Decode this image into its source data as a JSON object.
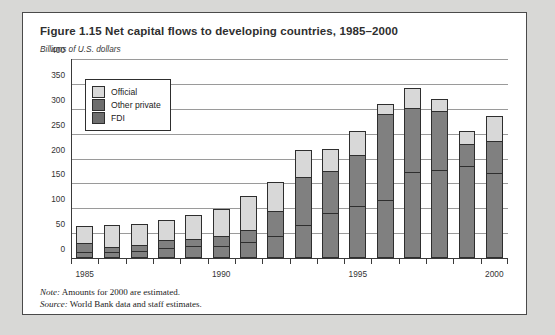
{
  "figure": {
    "title": "Figure 1.15  Net capital flows to developing countries, 1985–2000",
    "unit_label": "Billions of U.S. dollars",
    "note_key": "Note:",
    "note_text": " Amounts for 2000 are estimated.",
    "source_key": "Source:",
    "source_text": " World Bank data and staff estimates."
  },
  "legend": {
    "items": [
      {
        "label": "Official",
        "color": "#d8d8d8"
      },
      {
        "label": "Other private",
        "color": "#6e6e6e"
      },
      {
        "label": "FDI",
        "color": "#6e6e6e"
      }
    ]
  },
  "chart_data": {
    "type": "bar",
    "stacked": true,
    "title": "Figure 1.15  Net capital flows to developing countries, 1985–2000",
    "xlabel": "",
    "ylabel": "Billions of U.S. dollars",
    "ylim": [
      0,
      400
    ],
    "yticks": [
      0,
      50,
      100,
      150,
      200,
      250,
      300,
      350,
      400
    ],
    "grid": true,
    "legend_position": "top-left",
    "categories": [
      1985,
      1986,
      1987,
      1988,
      1989,
      1990,
      1991,
      1992,
      1993,
      1994,
      1995,
      1996,
      1997,
      1998,
      1999,
      2000
    ],
    "xtick_labels": [
      "1985",
      "1990",
      "1995",
      "2000"
    ],
    "xtick_label_years": [
      1985,
      1990,
      1995,
      2000
    ],
    "series": [
      {
        "name": "FDI",
        "color": "#808080",
        "values": [
          12,
          12,
          14,
          20,
          24,
          24,
          33,
          45,
          66,
          90,
          104,
          117,
          172,
          176,
          185,
          170
        ]
      },
      {
        "name": "Other private",
        "color": "#808080",
        "values": [
          18,
          10,
          12,
          16,
          14,
          20,
          24,
          50,
          96,
          85,
          103,
          173,
          130,
          120,
          45,
          65
        ]
      },
      {
        "name": "Official",
        "color": "#d8d8d8",
        "values": [
          35,
          44,
          42,
          40,
          48,
          54,
          68,
          57,
          56,
          45,
          48,
          20,
          40,
          24,
          25,
          50
        ]
      }
    ],
    "totals": [
      65,
      66,
      68,
      76,
      86,
      98,
      125,
      152,
      218,
      220,
      255,
      310,
      342,
      320,
      255,
      285
    ]
  }
}
